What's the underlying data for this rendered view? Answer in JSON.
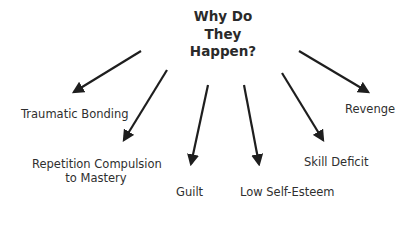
{
  "diagram": {
    "title_lines": [
      "Why Do",
      "They",
      "Happen?"
    ],
    "branches": [
      {
        "label_lines": [
          "Traumatic Bonding"
        ]
      },
      {
        "label_lines": [
          "Repetition Compulsion",
          "to Mastery"
        ]
      },
      {
        "label_lines": [
          "Guilt"
        ]
      },
      {
        "label_lines": [
          "Low Self-Esteem"
        ]
      },
      {
        "label_lines": [
          "Skill Deficit"
        ]
      },
      {
        "label_lines": [
          "Revenge"
        ]
      }
    ],
    "colors": {
      "arrow": "#1e1e1e",
      "text": "#2f2f2f",
      "background": "#ffffff"
    }
  }
}
